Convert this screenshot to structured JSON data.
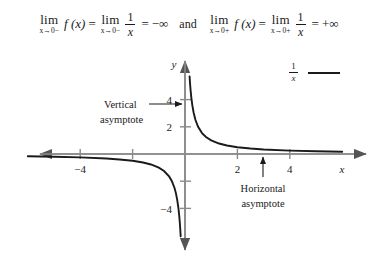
{
  "equation": {
    "left": {
      "lim1_word": "lim",
      "lim1_sub": "x→0−",
      "function": "f (x)",
      "equals1": "=",
      "lim2_word": "lim",
      "lim2_sub": "x→0−",
      "frac_num": "1",
      "frac_den": "x",
      "equals2": "=",
      "result": "−∞"
    },
    "conjunction": "and",
    "right": {
      "lim1_word": "lim",
      "lim1_sub": "x→0+",
      "function": "f (x)",
      "equals1": "=",
      "lim2_word": "lim",
      "lim2_sub": "x→0+",
      "frac_num": "1",
      "frac_den": "x",
      "equals2": "=",
      "result": "+∞"
    }
  },
  "legend": {
    "frac_num": "1",
    "frac_den": "x"
  },
  "annotations": {
    "vertical_line1": "Vertical",
    "vertical_line2": "asymptote",
    "horizontal_line1": "Horizontal",
    "horizontal_line2": "asymptote"
  },
  "axes": {
    "x_label": "x",
    "y_label": "y",
    "x_ticks": [
      {
        "value": -4,
        "label": "−4"
      },
      {
        "value": -2,
        "label": ""
      },
      {
        "value": 2,
        "label": "2"
      },
      {
        "value": 4,
        "label": "4"
      }
    ],
    "y_ticks": [
      {
        "value": 4,
        "label": "4"
      },
      {
        "value": 2,
        "label": "2"
      },
      {
        "value": -2,
        "label": ""
      },
      {
        "value": -4,
        "label": "−4"
      }
    ]
  },
  "colors": {
    "curve": "#1a1a1a",
    "axis": "#8a8a8a",
    "text": "#1a1a1a",
    "background": "#ffffff"
  },
  "chart_data": {
    "type": "line",
    "title": "",
    "xlabel": "x",
    "ylabel": "y",
    "xlim": [
      -6.2,
      6.2
    ],
    "ylim": [
      -7.0,
      6.6
    ],
    "grid": false,
    "legend_position": "top-right",
    "series": [
      {
        "name": "1/x",
        "formula": "y = 1/x",
        "branches": [
          {
            "name": "left-branch",
            "x": [
              -6.0,
              -5.0,
              -4.0,
              -3.0,
              -2.5,
              -2.0,
              -1.6,
              -1.3,
              -1.0,
              -0.8,
              -0.6,
              -0.5,
              -0.4,
              -0.35,
              -0.3,
              -0.25,
              -0.22,
              -0.2,
              -0.18,
              -0.165
            ],
            "y": [
              -0.167,
              -0.2,
              -0.25,
              -0.333,
              -0.4,
              -0.5,
              -0.625,
              -0.769,
              -1.0,
              -1.25,
              -1.667,
              -2.0,
              -2.5,
              -2.857,
              -3.333,
              -4.0,
              -4.545,
              -5.0,
              -5.556,
              -6.06
            ]
          },
          {
            "name": "right-branch",
            "x": [
              0.175,
              0.19,
              0.21,
              0.24,
              0.28,
              0.33,
              0.4,
              0.5,
              0.65,
              0.8,
              1.0,
              1.3,
              1.6,
              2.0,
              2.5,
              3.0,
              4.0,
              5.0,
              6.0
            ],
            "y": [
              5.71,
              5.26,
              4.76,
              4.167,
              3.571,
              3.03,
              2.5,
              2.0,
              1.538,
              1.25,
              1.0,
              0.769,
              0.625,
              0.5,
              0.4,
              0.333,
              0.25,
              0.2,
              0.167
            ]
          }
        ]
      }
    ],
    "asymptotes": [
      {
        "kind": "vertical",
        "at": 0,
        "label": "Vertical asymptote"
      },
      {
        "kind": "horizontal",
        "at": 0,
        "label": "Horizontal asymptote"
      }
    ]
  }
}
